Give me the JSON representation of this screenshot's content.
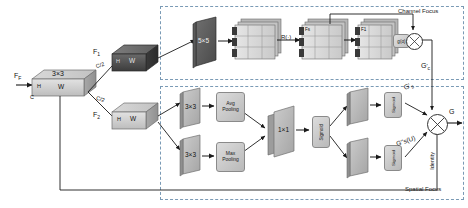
{
  "figure": {
    "groups": [
      {
        "id": "channel",
        "label": "Channel Focus"
      },
      {
        "id": "spatial",
        "label": "Spatial Focus"
      }
    ]
  },
  "input": {
    "feature_label": "F_F",
    "feature_label_main": "F",
    "feature_label_sub": "F",
    "conv_label": "3×3",
    "dim_h": "H",
    "dim_w": "W",
    "dim_c": "C"
  },
  "split": {
    "branch1": {
      "name_main": "F",
      "name_sub": "1",
      "channels": "C/2",
      "dim_h": "H",
      "dim_w": "W"
    },
    "branch2": {
      "name_main": "F",
      "name_sub": "2",
      "channels": "C/2",
      "dim_h": "H",
      "dim_w": "W"
    }
  },
  "channel_branch": {
    "conv_label": "5×5",
    "stack1_label": "F",
    "reshape_label": "R(·)",
    "stack2_label": "Fs",
    "stack3_label": "F1",
    "gate_label": "g(α)",
    "multiply_symbol": "⊗",
    "output_main": "G",
    "output_sub": "c",
    "output_prime": "'"
  },
  "spatial_branch": {
    "conv_top_label": "3×3",
    "conv_bottom_label": "3×3",
    "avg_pool_line1": "Avg",
    "avg_pool_line2": "Pooling",
    "max_pool_line1": "Max",
    "max_pool_line2": "Pooling",
    "concat_conv_label": "1×1",
    "sigmoid_mid_label": "Sigmoid",
    "sigmoid_top_label": "Sigmoid",
    "sigmoid_bottom_label": "Sigmoid",
    "out_top_main": "G",
    "out_top_sub": "s",
    "out_top_prime": "'",
    "out_bottom": "G''s(U)",
    "out_bottom_main": "G",
    "out_bottom_sub": "s",
    "out_bottom_arg": "(U)",
    "identity_label": "Identity"
  },
  "output": {
    "multiply_symbol": "⊗",
    "label": "G"
  },
  "colors": {
    "group_border": "#7a9ab5",
    "block_light": "#cfcfcf",
    "block_dark": "#4a4a4a",
    "block_mid": "#9a9a9a",
    "arrow": "#1a1a1a",
    "text": "#111111"
  }
}
